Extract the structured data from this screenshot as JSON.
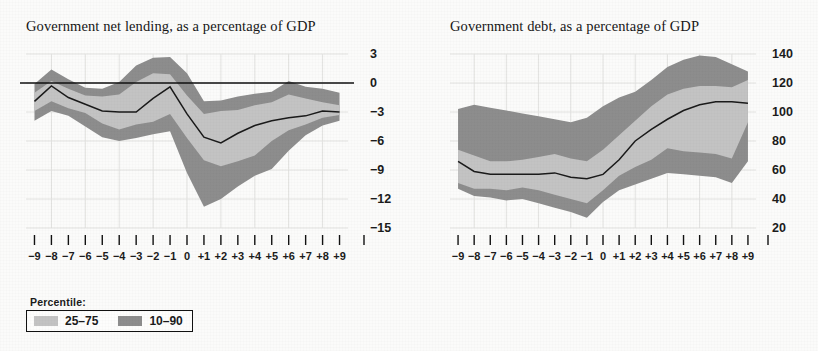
{
  "figure": {
    "background_color": "#fbfbfa",
    "band_outer_color": "#8d8d8d",
    "band_inner_color": "#c3c3c3",
    "median_color": "#1a1a1a"
  },
  "legend": {
    "title": "Percentile:",
    "entries": [
      {
        "label": "25–75",
        "color": "#c3c3c3",
        "swatch": "light"
      },
      {
        "label": "10–90",
        "color": "#8d8d8d",
        "swatch": "dark"
      }
    ]
  },
  "chart_data": [
    {
      "id": "net-lending",
      "type": "area",
      "title": "Government net lending, as a percentage of GDP",
      "xlabel": "",
      "ylabel": "",
      "xlim": [
        -9.5,
        9.5
      ],
      "ylim": [
        -15,
        3
      ],
      "yticks": [
        3,
        0,
        -3,
        -6,
        -9,
        -12,
        -15
      ],
      "ytick_labels": [
        "3",
        "0",
        "−3",
        "−6",
        "−9",
        "−12",
        "−15"
      ],
      "grid": true,
      "zero_line": 0,
      "x": [
        -9,
        -8,
        -7,
        -6,
        -5,
        -4,
        -3,
        -2,
        -1,
        0,
        1,
        2,
        3,
        4,
        5,
        6,
        7,
        8,
        9
      ],
      "xtick_labels": [
        "−9",
        "−8",
        "−7",
        "−6",
        "−5",
        "−4",
        "−3",
        "−2",
        "−1",
        "0",
        "+1",
        "+2",
        "+3",
        "+4",
        "+5",
        "+6",
        "+7",
        "+8",
        "+9"
      ],
      "series": [
        {
          "name": "p90",
          "values": [
            -0.1,
            1.4,
            0.4,
            -0.5,
            -0.6,
            0.1,
            1.8,
            2.6,
            2.7,
            1.0,
            -1.9,
            -1.8,
            -1.4,
            -1.1,
            -0.9,
            0.2,
            -0.4,
            -0.6,
            -1.0
          ]
        },
        {
          "name": "p75",
          "values": [
            -1.0,
            0.2,
            -0.6,
            -1.3,
            -1.4,
            -1.2,
            0.1,
            1.0,
            0.9,
            -1.3,
            -3.2,
            -2.9,
            -2.8,
            -2.3,
            -2.0,
            -1.2,
            -1.6,
            -2.0,
            -2.3
          ]
        },
        {
          "name": "median",
          "values": [
            -1.9,
            -0.3,
            -1.5,
            -2.2,
            -2.9,
            -3.0,
            -3.0,
            -1.6,
            -0.4,
            -3.2,
            -5.6,
            -6.2,
            -5.2,
            -4.4,
            -3.9,
            -3.6,
            -3.4,
            -2.9,
            -3.0
          ]
        },
        {
          "name": "p25",
          "values": [
            -2.9,
            -1.9,
            -2.6,
            -3.1,
            -4.2,
            -4.8,
            -4.3,
            -4.0,
            -3.2,
            -5.7,
            -8.0,
            -8.6,
            -8.1,
            -7.5,
            -6.0,
            -4.9,
            -4.3,
            -3.6,
            -3.3
          ]
        },
        {
          "name": "p10",
          "values": [
            -3.9,
            -2.9,
            -3.4,
            -4.5,
            -5.6,
            -6.0,
            -5.7,
            -5.3,
            -5.0,
            -9.3,
            -12.8,
            -12.0,
            -10.7,
            -9.6,
            -8.9,
            -7.0,
            -5.4,
            -4.4,
            -3.9
          ]
        }
      ]
    },
    {
      "id": "debt",
      "type": "area",
      "title": "Government debt, as a percentage of GDP",
      "xlabel": "",
      "ylabel": "",
      "xlim": [
        -9.5,
        9.5
      ],
      "ylim": [
        20,
        140
      ],
      "yticks": [
        140,
        120,
        100,
        80,
        60,
        40,
        20
      ],
      "ytick_labels": [
        "140",
        "120",
        "100",
        "80",
        "60",
        "40",
        "20"
      ],
      "grid": true,
      "x": [
        -9,
        -8,
        -7,
        -6,
        -5,
        -4,
        -3,
        -2,
        -1,
        0,
        1,
        2,
        3,
        4,
        5,
        6,
        7,
        8,
        9
      ],
      "xtick_labels": [
        "−9",
        "−8",
        "−7",
        "−6",
        "−5",
        "−4",
        "−3",
        "−2",
        "−1",
        "0",
        "+1",
        "+2",
        "+3",
        "+4",
        "+5",
        "+6",
        "+7",
        "+8",
        "+9"
      ],
      "series": [
        {
          "name": "p90",
          "values": [
            102,
            105,
            103,
            101,
            99,
            97,
            95,
            93,
            96,
            104,
            110,
            114,
            122,
            131,
            136,
            139,
            138,
            133,
            128
          ]
        },
        {
          "name": "p75",
          "values": [
            74,
            70,
            66,
            66,
            67,
            69,
            71,
            68,
            66,
            74,
            84,
            94,
            104,
            112,
            116,
            118,
            118,
            117,
            122
          ]
        },
        {
          "name": "median",
          "values": [
            66,
            59,
            57,
            57,
            57,
            57,
            58,
            55,
            54,
            57,
            67,
            80,
            88,
            95,
            101,
            105,
            107,
            107,
            106
          ]
        },
        {
          "name": "p25",
          "values": [
            51,
            47,
            47,
            46,
            48,
            46,
            43,
            40,
            37,
            46,
            56,
            62,
            67,
            75,
            73,
            72,
            71,
            68,
            93
          ]
        },
        {
          "name": "p10",
          "values": [
            47,
            42,
            41,
            39,
            40,
            37,
            34,
            31,
            27,
            38,
            46,
            50,
            54,
            58,
            57,
            56,
            55,
            51,
            66
          ]
        }
      ]
    }
  ]
}
